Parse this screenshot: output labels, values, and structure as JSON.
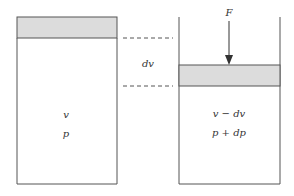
{
  "diagram": {
    "colors": {
      "stroke": "#555555",
      "piston_fill": "#dcdcdc",
      "background": "#ffffff",
      "text": "#333333"
    },
    "left_cylinder": {
      "volume_label": "v",
      "pressure_label": "p"
    },
    "right_cylinder": {
      "volume_label": "v − dv",
      "pressure_label": "p + dp",
      "force_label": "F"
    },
    "displacement_label": "dv"
  }
}
